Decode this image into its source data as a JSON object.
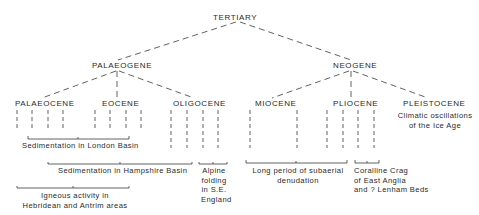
{
  "root": {
    "label": "TERTIARY"
  },
  "periods": [
    {
      "label": "PALAEOGENE"
    },
    {
      "label": "NEOGENE"
    }
  ],
  "epochs": [
    {
      "label": "PALAEOCENE"
    },
    {
      "label": "EOCENE"
    },
    {
      "label": "OLIGOCENE"
    },
    {
      "label": "MIOCENE"
    },
    {
      "label": "PLIOCENE"
    },
    {
      "label": "PLEISTOCENE"
    }
  ],
  "events": {
    "london_basin": "Sedimentation in London Basin",
    "hampshire_basin": "Sedimentation in Hampshire Basin",
    "igneous_line1": "Igneous activity in",
    "igneous_line2": "Hebridean and Antrim areas",
    "alpine_line1": "Alpine",
    "alpine_line2": "folding",
    "alpine_line3": "in S.E.",
    "alpine_line4": "England",
    "denudation_line1": "Long period of subaerial",
    "denudation_line2": "denudation",
    "coralline_line1": "Coralline Crag",
    "coralline_line2": "of East Anglia",
    "coralline_line3": "and ? Lenham Beds",
    "ice_age_line1": "Climatic oscillations",
    "ice_age_line2": "of the Ice Age"
  }
}
